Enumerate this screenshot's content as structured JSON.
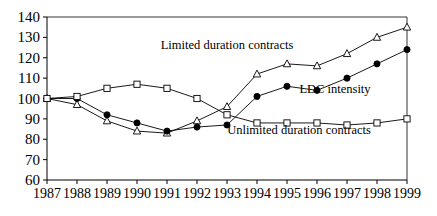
{
  "chart_data": {
    "type": "line",
    "title": "",
    "xlabel": "",
    "ylabel": "",
    "x": [
      1987,
      1988,
      1989,
      1990,
      1991,
      1992,
      1993,
      1994,
      1995,
      1996,
      1997,
      1998,
      1999
    ],
    "categories": [
      "1987",
      "1988",
      "1989",
      "1990",
      "1991",
      "1992",
      "1993",
      "1994",
      "1995",
      "1996",
      "1997",
      "1998",
      "1999"
    ],
    "xlim": [
      1987,
      1999
    ],
    "ylim": [
      60,
      140
    ],
    "yticks": [
      60,
      70,
      80,
      90,
      100,
      110,
      120,
      130,
      140
    ],
    "grid": false,
    "legend_position": "inline-annotations",
    "series": [
      {
        "name": "Limited duration contracts",
        "marker": "open-triangle",
        "values": [
          100,
          97,
          89,
          84,
          83,
          89,
          96,
          112,
          117,
          116,
          122,
          130,
          135
        ]
      },
      {
        "name": "LDC intensity",
        "marker": "filled-circle",
        "values": [
          100,
          100,
          92,
          88,
          84,
          86,
          87,
          101,
          106,
          104,
          110,
          117,
          124
        ]
      },
      {
        "name": "Unlimited duration contracts",
        "marker": "open-square",
        "values": [
          100,
          101,
          105,
          107,
          105,
          100,
          92,
          88,
          88,
          88,
          87,
          88,
          90
        ]
      }
    ],
    "annotations": [
      {
        "text": "Limited duration contracts",
        "x": 1993.0,
        "y": 126
      },
      {
        "text": "LDC intensity",
        "x": 1996.6,
        "y": 104
      },
      {
        "text": "Unlimited duration contracts",
        "x": 1995.4,
        "y": 84
      }
    ]
  },
  "colors": {
    "axis": "#000000",
    "line": "#000000",
    "marker_fill": "#ffffff",
    "background": "#ffffff"
  }
}
